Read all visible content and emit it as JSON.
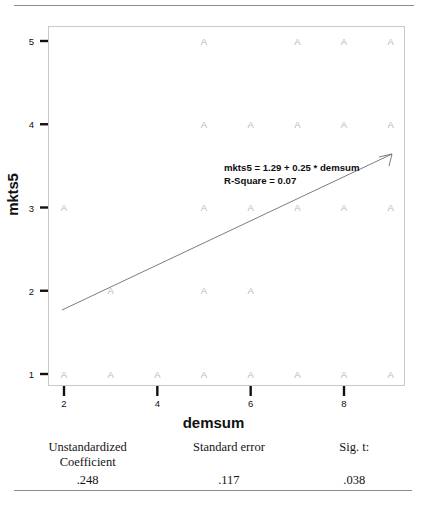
{
  "figure": {
    "y_axis_label": "mkts5",
    "x_axis_label": "demsum",
    "annotation_line1": "mkts5 = 1.29 + 0.25 * demsum",
    "annotation_line2": "R-Square = 0.07",
    "marker_glyph": "A"
  },
  "chart_data": {
    "type": "scatter",
    "title": "",
    "xlabel": "demsum",
    "ylabel": "mkts5",
    "xlim": [
      1.7,
      9.3
    ],
    "ylim": [
      0.8,
      5.25
    ],
    "xticks": [
      2,
      4,
      6,
      8
    ],
    "xticklabels": [
      "2",
      "4",
      "6",
      "8"
    ],
    "yticks": [
      1,
      2,
      3,
      4,
      5
    ],
    "yticklabels": [
      "1",
      "2",
      "3",
      "4",
      "5"
    ],
    "grid": false,
    "legend": false,
    "marker": "A",
    "marker_color": "#b9b9b9",
    "points": [
      {
        "x": 5,
        "y": 5
      },
      {
        "x": 7,
        "y": 5
      },
      {
        "x": 8,
        "y": 5
      },
      {
        "x": 9,
        "y": 5
      },
      {
        "x": 5,
        "y": 4
      },
      {
        "x": 6,
        "y": 4
      },
      {
        "x": 7,
        "y": 4
      },
      {
        "x": 8,
        "y": 4
      },
      {
        "x": 9,
        "y": 4
      },
      {
        "x": 2,
        "y": 3
      },
      {
        "x": 5,
        "y": 3
      },
      {
        "x": 6,
        "y": 3
      },
      {
        "x": 7,
        "y": 3
      },
      {
        "x": 8,
        "y": 3
      },
      {
        "x": 9,
        "y": 3
      },
      {
        "x": 3,
        "y": 2
      },
      {
        "x": 5,
        "y": 2
      },
      {
        "x": 6,
        "y": 2
      },
      {
        "x": 2,
        "y": 1
      },
      {
        "x": 3,
        "y": 1
      },
      {
        "x": 4,
        "y": 1
      },
      {
        "x": 5,
        "y": 1
      },
      {
        "x": 6,
        "y": 1
      },
      {
        "x": 7,
        "y": 1
      },
      {
        "x": 8,
        "y": 1
      },
      {
        "x": 9,
        "y": 1
      }
    ],
    "fit_line": {
      "equation": "mkts5 = 1.29 + 0.25 * demsum",
      "intercept": 1.29,
      "slope": 0.25,
      "r_square": 0.07,
      "x_start": 2,
      "x_end": 9.1,
      "color": "#6d6d6d"
    }
  },
  "stats_table": {
    "headers": [
      "Unstandardized\nCoefficient",
      "Standard error",
      "Sig. t:"
    ],
    "header_col1_line1": "Unstandardized",
    "header_col1_line2": "Coefficient",
    "header_col2": "Standard error",
    "header_col3": "Sig. t:",
    "values": [
      ".248",
      ".117",
      ".038"
    ]
  },
  "colors": {
    "rule": "#8d8d8d",
    "frame": "#c9c9c9",
    "tick": "#111111",
    "marker": "#b9b9b9",
    "fit_line": "#6d6d6d",
    "text": "#141414"
  }
}
